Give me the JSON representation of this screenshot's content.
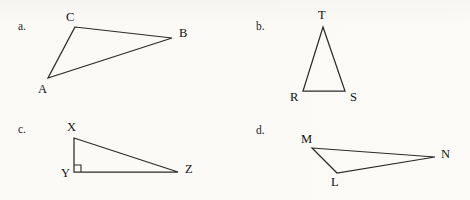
{
  "page": {
    "background_color": "#fbfaf7",
    "stroke_color": "#2b2b2b",
    "text_color": "#111111",
    "width": 470,
    "height": 200
  },
  "items": [
    {
      "letter": "a.",
      "letter_pos": {
        "x": 18,
        "y": 30
      },
      "triangle": {
        "name": "triangle-abc",
        "points": "75,27 172,38 48,78",
        "vertices": [
          {
            "label": "C",
            "x": 75,
            "y": 27,
            "label_x": 66,
            "label_y": 21
          },
          {
            "label": "B",
            "x": 172,
            "y": 38,
            "label_x": 179,
            "label_y": 37
          },
          {
            "label": "A",
            "x": 48,
            "y": 78,
            "label_x": 38,
            "label_y": 93
          }
        ],
        "right_angle_at": null
      }
    },
    {
      "letter": "b.",
      "letter_pos": {
        "x": 256,
        "y": 30
      },
      "triangle": {
        "name": "triangle-rst",
        "points": "323,27 345,91 303,91",
        "vertices": [
          {
            "label": "T",
            "x": 323,
            "y": 27,
            "label_x": 318,
            "label_y": 19
          },
          {
            "label": "S",
            "x": 345,
            "y": 91,
            "label_x": 350,
            "label_y": 101
          },
          {
            "label": "R",
            "x": 303,
            "y": 91,
            "label_x": 290,
            "label_y": 101
          }
        ],
        "right_angle_at": null
      }
    },
    {
      "letter": "c.",
      "letter_pos": {
        "x": 18,
        "y": 133
      },
      "triangle": {
        "name": "triangle-xyz",
        "points": "74,138 178,172 74,172",
        "vertices": [
          {
            "label": "X",
            "x": 74,
            "y": 138,
            "label_x": 67,
            "label_y": 131
          },
          {
            "label": "Z",
            "x": 178,
            "y": 172,
            "label_x": 185,
            "label_y": 173
          },
          {
            "label": "Y",
            "x": 74,
            "y": 172,
            "label_x": 61,
            "label_y": 177
          }
        ],
        "right_angle_at": {
          "x": 74,
          "y": 172,
          "size": 7
        }
      }
    },
    {
      "letter": "d.",
      "letter_pos": {
        "x": 256,
        "y": 134
      },
      "triangle": {
        "name": "triangle-lmn",
        "points": "312,148 435,157 337,173",
        "vertices": [
          {
            "label": "M",
            "x": 312,
            "y": 148,
            "label_x": 301,
            "label_y": 143
          },
          {
            "label": "N",
            "x": 435,
            "y": 157,
            "label_x": 441,
            "label_y": 158
          },
          {
            "label": "L",
            "x": 337,
            "y": 173,
            "label_x": 331,
            "label_y": 186
          }
        ],
        "right_angle_at": null
      }
    }
  ]
}
